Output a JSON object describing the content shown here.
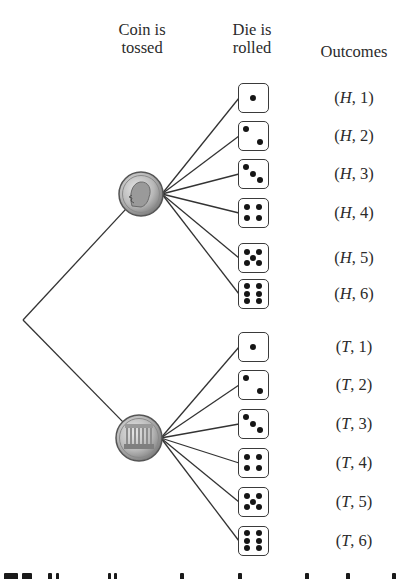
{
  "headers": {
    "coin": [
      "Coin is",
      "tossed"
    ],
    "die": [
      "Die is",
      "rolled"
    ],
    "outcomes": "Outcomes"
  },
  "tree": {
    "root": {
      "x": 23,
      "y": 320
    },
    "coins": [
      {
        "face": "H",
        "label": "heads-coin",
        "cx": 141,
        "cy": 194,
        "r": 22
      },
      {
        "face": "T",
        "label": "tails-coin",
        "cx": 139,
        "cy": 438,
        "r": 23
      }
    ],
    "line_color": "#333333"
  },
  "branches": [
    {
      "coin": "H",
      "rows": [
        {
          "die": 1,
          "outcome_coin": "H",
          "outcome_num": "1",
          "y": 83
        },
        {
          "die": 2,
          "outcome_coin": "H",
          "outcome_num": "2",
          "y": 121
        },
        {
          "die": 3,
          "outcome_coin": "H",
          "outcome_num": "3",
          "y": 159
        },
        {
          "die": 4,
          "outcome_coin": "H",
          "outcome_num": "4",
          "y": 198
        },
        {
          "die": 5,
          "outcome_coin": "H",
          "outcome_num": "5",
          "y": 243
        },
        {
          "die": 6,
          "outcome_coin": "H",
          "outcome_num": "6",
          "y": 279
        }
      ]
    },
    {
      "coin": "T",
      "rows": [
        {
          "die": 1,
          "outcome_coin": "T",
          "outcome_num": "1",
          "y": 332
        },
        {
          "die": 2,
          "outcome_coin": "T",
          "outcome_num": "2",
          "y": 370
        },
        {
          "die": 3,
          "outcome_coin": "T",
          "outcome_num": "3",
          "y": 409
        },
        {
          "die": 4,
          "outcome_coin": "T",
          "outcome_num": "4",
          "y": 448
        },
        {
          "die": 5,
          "outcome_coin": "T",
          "outcome_num": "5",
          "y": 487
        },
        {
          "die": 6,
          "outcome_coin": "T",
          "outcome_num": "6",
          "y": 526
        }
      ]
    }
  ]
}
